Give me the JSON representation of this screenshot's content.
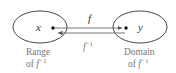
{
  "diagram": {
    "left_set": {
      "element": "x",
      "caption_line1": "Range",
      "caption_line2_prefix": "of ",
      "caption_line2_fn": "f",
      "caption_line2_sup": "−1"
    },
    "right_set": {
      "element": "y",
      "caption_line1": "Domain",
      "caption_line2_prefix": "of ",
      "caption_line2_fn": "f",
      "caption_line2_sup": "−1"
    },
    "forward_arrow": {
      "label": "f"
    },
    "inverse_arrow": {
      "label_fn": "f",
      "label_sup": "−1"
    },
    "colors": {
      "stroke": "#333333",
      "caption": "#777777"
    }
  }
}
